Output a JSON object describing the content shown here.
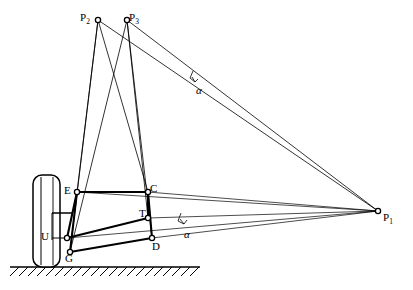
{
  "diagram": {
    "type": "kinematic-linkage",
    "stroke_color": "#000000",
    "background_color": "#ffffff",
    "labels": {
      "p1": {
        "text": "P",
        "sub": "1",
        "x": 383,
        "y": 212
      },
      "p2": {
        "text": "P",
        "sub": "2",
        "x": 80,
        "y": 12
      },
      "p3": {
        "text": "P",
        "sub": "3",
        "x": 129,
        "y": 12
      },
      "e": {
        "text": "E",
        "x": 64,
        "y": 185
      },
      "c": {
        "text": "C",
        "x": 150,
        "y": 183
      },
      "t": {
        "text": "T",
        "x": 139,
        "y": 208
      },
      "d": {
        "text": "D",
        "x": 152,
        "y": 241
      },
      "u": {
        "text": "U",
        "x": 41,
        "y": 231
      },
      "g": {
        "text": "G",
        "x": 65,
        "y": 253
      },
      "alpha_upper": {
        "text": "α",
        "x": 196,
        "y": 85
      },
      "alpha_lower": {
        "text": "α",
        "x": 184,
        "y": 229
      }
    },
    "nodes": {
      "P1": {
        "x": 378,
        "y": 211
      },
      "P2": {
        "x": 98,
        "y": 20
      },
      "P3": {
        "x": 127,
        "y": 20
      },
      "E": {
        "x": 77,
        "y": 192
      },
      "C": {
        "x": 148,
        "y": 192
      },
      "T": {
        "x": 148,
        "y": 218
      },
      "D": {
        "x": 152,
        "y": 238
      },
      "U": {
        "x": 67,
        "y": 238
      },
      "G": {
        "x": 70,
        "y": 252
      }
    },
    "wheel": {
      "x": 33,
      "y": 175,
      "width": 27,
      "height": 92,
      "radius": 9
    },
    "ground": {
      "y": 267,
      "x_start": 10,
      "x_end": 200
    },
    "hatch": {
      "count": 21,
      "spacing": 9,
      "length": 9
    }
  }
}
